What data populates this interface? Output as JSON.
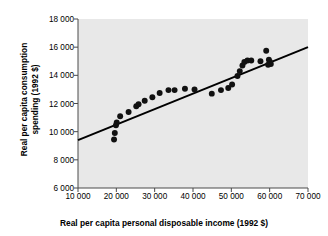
{
  "chart_data": {
    "type": "scatter",
    "title": "",
    "xlabel": "Real per capita personal disposable income (1992 $)",
    "ylabel_line1": "Real per capita consumption",
    "ylabel_line2": "spending (1992 $)",
    "xlim": [
      10000,
      70000
    ],
    "ylim": [
      6000,
      18000
    ],
    "xticks": [
      10000,
      20000,
      30000,
      40000,
      50000,
      60000,
      70000
    ],
    "yticks": [
      6000,
      8000,
      10000,
      12000,
      14000,
      16000,
      18000
    ],
    "xtick_labels": [
      "10 000",
      "20 000",
      "30 000",
      "40 000",
      "50 000",
      "60 000",
      "70 000"
    ],
    "ytick_labels": [
      "6 000",
      "8 000",
      "10 000",
      "12 000",
      "14 000",
      "16 000",
      "18 000"
    ],
    "grid": false,
    "legend": null,
    "plot_background": "#e8e8e8",
    "marker_color": "#111111",
    "marker_size": 4.6,
    "trendline": {
      "label": "regression line",
      "color": "#000000",
      "width": 2.0,
      "x_start": 10000,
      "y_start": 9400,
      "x_end": 70000,
      "y_end": 16000
    },
    "points": [
      {
        "x": 19400,
        "y": 9450
      },
      {
        "x": 19600,
        "y": 9900
      },
      {
        "x": 19900,
        "y": 10450
      },
      {
        "x": 20100,
        "y": 10650
      },
      {
        "x": 21000,
        "y": 11100
      },
      {
        "x": 23200,
        "y": 11400
      },
      {
        "x": 25200,
        "y": 11800
      },
      {
        "x": 25800,
        "y": 11950
      },
      {
        "x": 27400,
        "y": 12200
      },
      {
        "x": 29400,
        "y": 12450
      },
      {
        "x": 31300,
        "y": 12750
      },
      {
        "x": 33600,
        "y": 12950
      },
      {
        "x": 35200,
        "y": 12950
      },
      {
        "x": 37900,
        "y": 13050
      },
      {
        "x": 40400,
        "y": 13000
      },
      {
        "x": 44900,
        "y": 12700
      },
      {
        "x": 47300,
        "y": 12950
      },
      {
        "x": 49200,
        "y": 13100
      },
      {
        "x": 50200,
        "y": 13350
      },
      {
        "x": 51600,
        "y": 13950
      },
      {
        "x": 52200,
        "y": 14300
      },
      {
        "x": 52900,
        "y": 14700
      },
      {
        "x": 53400,
        "y": 14950
      },
      {
        "x": 54200,
        "y": 15050
      },
      {
        "x": 55200,
        "y": 15050
      },
      {
        "x": 57600,
        "y": 15000
      },
      {
        "x": 59100,
        "y": 15750
      },
      {
        "x": 59800,
        "y": 15100
      },
      {
        "x": 60100,
        "y": 14950
      },
      {
        "x": 60300,
        "y": 14800
      },
      {
        "x": 59600,
        "y": 14750
      }
    ]
  }
}
